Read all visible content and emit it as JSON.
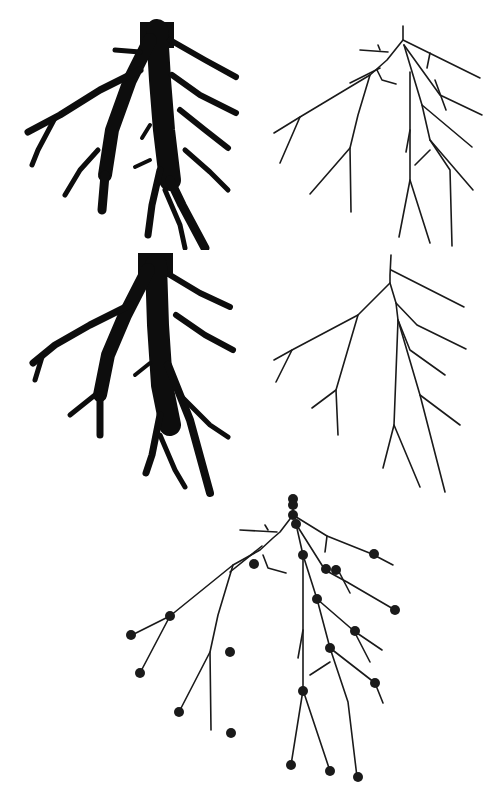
{
  "figure": {
    "panels": [
      {
        "id": "a",
        "description": "Binary root silhouette (original)",
        "position": "top-left"
      },
      {
        "id": "b",
        "description": "Skeleton of original root",
        "position": "top-right"
      },
      {
        "id": "c",
        "description": "Binary root silhouette (pruned/smoothed)",
        "position": "middle-left"
      },
      {
        "id": "d",
        "description": "Skeleton of pruned root",
        "position": "middle-right"
      },
      {
        "id": "e",
        "description": "Skeleton with graph nodes overlaid",
        "position": "bottom-center"
      }
    ],
    "colors": {
      "foreground": "#0d0d0d",
      "background": "#ffffff"
    },
    "node_count": 27
  }
}
